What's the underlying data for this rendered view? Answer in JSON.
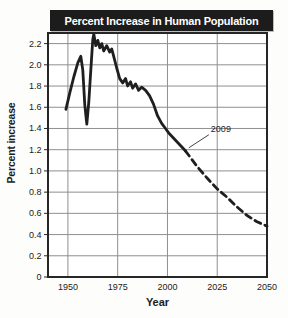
{
  "chart_data": {
    "type": "line",
    "title": "Percent Increase in Human Population",
    "xlabel": "Year",
    "ylabel": "Percent increase",
    "xlim": [
      1940,
      2050
    ],
    "ylim": [
      0,
      2.3
    ],
    "grid": true,
    "x_tick_values": [
      1950,
      1975,
      2000,
      2025,
      2050
    ],
    "x_tick_labels": [
      "1950",
      "1975",
      "2000",
      "2025",
      "2050"
    ],
    "y_tick_values": [
      0,
      0.2,
      0.4,
      0.6,
      0.8,
      1.0,
      1.2,
      1.4,
      1.6,
      1.8,
      2.0,
      2.2
    ],
    "y_tick_labels": [
      "0",
      "0.2",
      "0.4",
      "0.6",
      "0.8",
      "1.0",
      "1.2",
      "1.4",
      "1.6",
      "1.8",
      "2.0",
      "2.2"
    ],
    "series": [
      {
        "name": "observed",
        "style": "solid",
        "points": [
          [
            1949,
            1.58
          ],
          [
            1951,
            1.74
          ],
          [
            1953,
            1.89
          ],
          [
            1955,
            2.02
          ],
          [
            1956.5,
            2.08
          ],
          [
            1957.5,
            1.95
          ],
          [
            1958.5,
            1.62
          ],
          [
            1959.5,
            1.44
          ],
          [
            1960.5,
            1.65
          ],
          [
            1961.5,
            1.95
          ],
          [
            1962.5,
            2.24
          ],
          [
            1963,
            2.29
          ],
          [
            1964,
            2.18
          ],
          [
            1965,
            2.23
          ],
          [
            1966,
            2.16
          ],
          [
            1967,
            2.2
          ],
          [
            1968,
            2.13
          ],
          [
            1969.5,
            2.18
          ],
          [
            1971,
            2.12
          ],
          [
            1972,
            2.15
          ],
          [
            1973,
            2.08
          ],
          [
            1974.5,
            1.97
          ],
          [
            1976,
            1.87
          ],
          [
            1977.5,
            1.83
          ],
          [
            1979,
            1.87
          ],
          [
            1980,
            1.8
          ],
          [
            1981.5,
            1.84
          ],
          [
            1982.5,
            1.78
          ],
          [
            1984,
            1.82
          ],
          [
            1985.5,
            1.76
          ],
          [
            1987,
            1.79
          ],
          [
            1989,
            1.76
          ],
          [
            1991,
            1.71
          ],
          [
            1993,
            1.63
          ],
          [
            1995,
            1.52
          ],
          [
            1997,
            1.45
          ],
          [
            1999,
            1.4
          ],
          [
            2001,
            1.35
          ],
          [
            2003,
            1.31
          ],
          [
            2005,
            1.27
          ],
          [
            2007,
            1.23
          ],
          [
            2009,
            1.19
          ]
        ]
      },
      {
        "name": "projected",
        "style": "dashed",
        "points": [
          [
            2009,
            1.19
          ],
          [
            2015,
            1.04
          ],
          [
            2020,
            0.93
          ],
          [
            2025,
            0.83
          ],
          [
            2030,
            0.75
          ],
          [
            2035,
            0.66
          ],
          [
            2040,
            0.58
          ],
          [
            2045,
            0.52
          ],
          [
            2050,
            0.48
          ]
        ]
      }
    ],
    "annotation": {
      "label": "2009",
      "target": [
        2009,
        1.19
      ]
    },
    "colors": {
      "title_bar_bg": "#1c1c1c",
      "title_text": "#ffffff",
      "line": "#1f1f1f",
      "grid": "#8f8f8f",
      "border": "#262626",
      "background": "#fdfdfc",
      "annotation_line": "#444444"
    }
  }
}
